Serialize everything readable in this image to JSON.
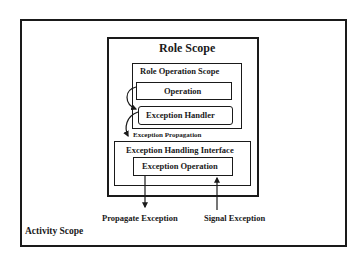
{
  "diagram": {
    "activity_scope": {
      "label": "Activity Scope"
    },
    "role_scope": {
      "label": "Role Scope"
    },
    "role_operation_scope": {
      "label": "Role Operation Scope"
    },
    "operation": {
      "label": "Operation"
    },
    "exception_handler": {
      "label": "Exception Handler"
    },
    "exception_propagation": {
      "label": "Exception Propagation"
    },
    "exception_handling_interface": {
      "label": "Exception Handling Interface"
    },
    "exception_operation": {
      "label": "Exception Operation"
    },
    "propagate_exception": {
      "label": "Propagate Exception"
    },
    "signal_exception": {
      "label": "Signal Exception"
    }
  },
  "colors": {
    "stroke": "#1a1a1a",
    "background": "#ffffff"
  }
}
